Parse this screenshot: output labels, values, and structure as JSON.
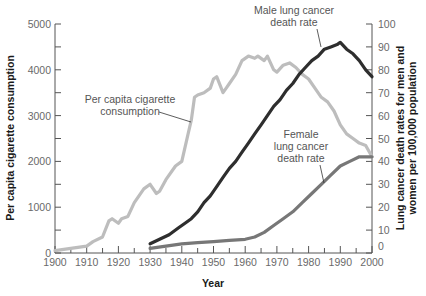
{
  "chart_data": {
    "type": "line",
    "title": "",
    "xlabel": "Year",
    "ylabel": "Per capita cigarette consumption",
    "ylabel_right": [
      "Lung cancer death rates for men and",
      "women per 100,000 population"
    ],
    "xlim": [
      1900,
      2000
    ],
    "ylim": [
      0,
      5000
    ],
    "ylim_right": [
      0,
      100
    ],
    "grid": false,
    "legend": "none (inline annotations)",
    "x_ticks": [
      "1900",
      "1910",
      "1920",
      "1930",
      "1940",
      "1950",
      "1960",
      "1970",
      "1980",
      "1990",
      "2000"
    ],
    "y_ticks_left": [
      "0",
      "1000",
      "2000",
      "3000",
      "4000",
      "5000"
    ],
    "y_ticks_right": [
      "0",
      "10",
      "20",
      "30",
      "40",
      "50",
      "60",
      "70",
      "80",
      "90",
      "100"
    ],
    "series": [
      {
        "name": "Per capita cigarette consumption",
        "axis": "left",
        "color": "#bdbdbd",
        "x": [
          1900,
          1905,
          1910,
          1912,
          1915,
          1917,
          1918,
          1920,
          1921,
          1923,
          1925,
          1928,
          1930,
          1932,
          1933,
          1935,
          1938,
          1940,
          1942,
          1943,
          1944,
          1945,
          1947,
          1949,
          1950,
          1951,
          1953,
          1954,
          1955,
          1957,
          1959,
          1961,
          1963,
          1964,
          1966,
          1967,
          1969,
          1970,
          1972,
          1974,
          1976,
          1978,
          1980,
          1982,
          1984,
          1986,
          1988,
          1990,
          1992,
          1994,
          1996,
          1998,
          2000
        ],
        "values": [
          50,
          100,
          150,
          250,
          350,
          700,
          750,
          650,
          750,
          800,
          1100,
          1400,
          1500,
          1300,
          1350,
          1600,
          1900,
          2000,
          2600,
          2900,
          3400,
          3450,
          3500,
          3600,
          3800,
          3850,
          3500,
          3600,
          3700,
          3900,
          4200,
          4300,
          4250,
          4300,
          4200,
          4300,
          4000,
          3950,
          4100,
          4150,
          4050,
          3900,
          3800,
          3600,
          3400,
          3300,
          3100,
          2800,
          2600,
          2500,
          2400,
          2350,
          2100
        ]
      },
      {
        "name": "Male lung cancer death rate",
        "axis": "right",
        "color": "#2e2e2e",
        "x": [
          1930,
          1933,
          1936,
          1939,
          1941,
          1943,
          1945,
          1947,
          1949,
          1951,
          1953,
          1955,
          1957,
          1959,
          1961,
          1963,
          1965,
          1967,
          1969,
          1971,
          1973,
          1975,
          1977,
          1979,
          1981,
          1983,
          1985,
          1987,
          1989,
          1990,
          1992,
          1994,
          1996,
          1998,
          2000
        ],
        "values": [
          4,
          6,
          8,
          11,
          13,
          15,
          18,
          22,
          25,
          29,
          33,
          37,
          40,
          44,
          48,
          52,
          56,
          60,
          64,
          67,
          71,
          74,
          78,
          81,
          84,
          86,
          89,
          90,
          91,
          92,
          89,
          87,
          84,
          80,
          77
        ]
      },
      {
        "name": "Female lung cancer death rate",
        "axis": "right",
        "color": "#777777",
        "x": [
          1930,
          1935,
          1940,
          1945,
          1950,
          1955,
          1960,
          1963,
          1966,
          1969,
          1972,
          1975,
          1978,
          1981,
          1984,
          1987,
          1990,
          1993,
          1996,
          2000
        ],
        "values": [
          2,
          3,
          4,
          4.5,
          5,
          5.5,
          6,
          7,
          9,
          12,
          15,
          18,
          22,
          26,
          30,
          34,
          38,
          40,
          42,
          42
        ]
      }
    ],
    "annotations": [
      {
        "text": [
          "Per capita cigarette",
          "consumption"
        ],
        "target_series": "Per capita cigarette consumption"
      },
      {
        "text": [
          "Male lung cancer",
          "death rate"
        ],
        "target_series": "Male lung cancer death rate"
      },
      {
        "text": [
          "Female",
          "lung cancer",
          "death rate"
        ],
        "target_series": "Female lung cancer death rate"
      }
    ]
  },
  "labels": {
    "xlabel": "Year",
    "ylabel_left": "Per capita cigarette consumption",
    "ylabel_right_1": "Lung cancer death rates for men and",
    "ylabel_right_2": "women per 100,000 population",
    "cig_1": "Per capita cigarette",
    "cig_2": "consumption",
    "male_1": "Male lung cancer",
    "male_2": "death rate",
    "female_1": "Female",
    "female_2": "lung cancer",
    "female_3": "death rate"
  }
}
